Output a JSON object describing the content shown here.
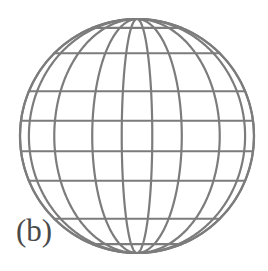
{
  "figure": {
    "panel_label": "(b)",
    "label_color": "#4a4a4a",
    "background_color": "#ffffff",
    "line_color": "#7c7c7c",
    "line_width": 2.2
  },
  "chart_data": {
    "type": "line",
    "title": "(b)",
    "subtitle": "",
    "projection": "orthographic-globe-graticule",
    "xlabel": "",
    "ylabel": "",
    "grid": true,
    "legend": false,
    "circle": {
      "center_x": 137,
      "center_y": 136,
      "radius": 117,
      "cx_px": 137,
      "cy_px": 136,
      "r_px": 117
    },
    "view": {
      "center_longitude_deg": 0,
      "center_latitude_deg": 0,
      "tilt_deg": 0
    },
    "meridians": {
      "name": "meridians",
      "longitudes_deg": [
        -90,
        -67.5,
        -45,
        -22.5,
        -7.5,
        7.5,
        22.5,
        45,
        67.5,
        90
      ],
      "count": 10,
      "x_px_at_equator": [
        20,
        48,
        84,
        111,
        128,
        146,
        163,
        190,
        226,
        254
      ]
    },
    "parallels": {
      "name": "parallels",
      "latitudes_deg": [
        -90,
        -67.5,
        -45,
        -22.5,
        -7.5,
        7.5,
        22.5,
        45,
        67.5,
        90
      ],
      "count": 10,
      "y_px_at_central_meridian": [
        19,
        41,
        78,
        105,
        125,
        147,
        167,
        194,
        231,
        253
      ]
    },
    "outline": {
      "name": "limb-circle",
      "described": "full circular disc boundary"
    }
  }
}
